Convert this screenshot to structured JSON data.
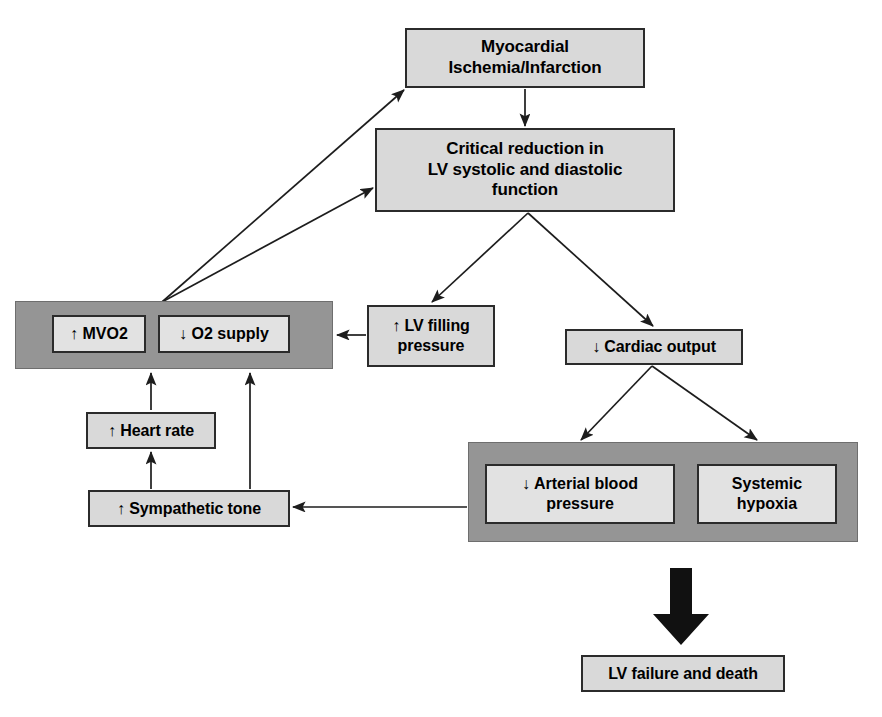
{
  "diagram": {
    "colors": {
      "group_fill": "#959595",
      "node_fill": "#d9d9d9",
      "inner_fill": "#e2e2e2",
      "stroke": "#2b2b2b",
      "text": "#000000",
      "fat_arrow": "#111111"
    },
    "nodes": [
      {
        "id": "myocardial",
        "label": "Myocardial\nIschemia/Infarction",
        "x": 405,
        "y": 28,
        "w": 240,
        "h": 60,
        "font": 17
      },
      {
        "id": "critical",
        "label": "Critical reduction in\nLV systolic and diastolic\nfunction",
        "x": 375,
        "y": 128,
        "w": 300,
        "h": 84,
        "font": 17
      },
      {
        "id": "lv-filling",
        "label": "↑ LV filling\npressure",
        "x": 367,
        "y": 305,
        "w": 128,
        "h": 62,
        "font": 16
      },
      {
        "id": "cardiac-output",
        "label": "↓ Cardiac output",
        "x": 565,
        "y": 329,
        "w": 178,
        "h": 36,
        "font": 16
      },
      {
        "id": "heart-rate",
        "label": "↑ Heart rate",
        "x": 86,
        "y": 412,
        "w": 130,
        "h": 37,
        "font": 16
      },
      {
        "id": "sympathetic",
        "label": "↑ Sympathetic tone",
        "x": 88,
        "y": 490,
        "w": 202,
        "h": 37,
        "font": 16
      },
      {
        "id": "lv-failure",
        "label": "LV failure and death",
        "x": 581,
        "y": 655,
        "w": 204,
        "h": 37,
        "font": 16
      }
    ],
    "groups": [
      {
        "id": "oxygen-balance-group",
        "x": 15,
        "y": 301,
        "w": 318,
        "h": 68,
        "children": [
          {
            "id": "mvo2",
            "label": "↑ MVO2",
            "x": 52,
            "y": 315,
            "w": 94,
            "h": 38,
            "font": 16
          },
          {
            "id": "o2-supply",
            "label": "↓ O2 supply",
            "x": 158,
            "y": 315,
            "w": 132,
            "h": 38,
            "font": 16
          }
        ]
      },
      {
        "id": "systemic-consequences-group",
        "x": 468,
        "y": 442,
        "w": 390,
        "h": 100,
        "children": [
          {
            "id": "arterial-bp",
            "label": "↓ Arterial blood\npressure",
            "x": 485,
            "y": 464,
            "w": 190,
            "h": 60,
            "font": 16
          },
          {
            "id": "systemic-hypoxia",
            "label": "Systemic\nhypoxia",
            "x": 697,
            "y": 464,
            "w": 140,
            "h": 60,
            "font": 16
          }
        ]
      }
    ],
    "connectors": [
      {
        "id": "oxygen-to-myocardial",
        "from": "oxygen-balance-group",
        "to": "myocardial",
        "points": "162,302 404,90",
        "arrow": "end"
      },
      {
        "id": "oxygen-to-critical",
        "from": "oxygen-balance-group",
        "to": "critical",
        "points": "162,302 373,188",
        "arrow": "end"
      },
      {
        "id": "myocardial-to-critical",
        "from": "myocardial",
        "to": "critical",
        "points": "525,89 525,126",
        "arrow": "end"
      },
      {
        "id": "critical-to-lv-filling",
        "from": "critical",
        "to": "lv-filling",
        "points": "528,213 432,302",
        "arrow": "end"
      },
      {
        "id": "critical-to-cardiac-output",
        "from": "critical",
        "to": "cardiac-output",
        "points": "528,213 653,326",
        "arrow": "end"
      },
      {
        "id": "lv-filling-to-o2-supply",
        "from": "lv-filling",
        "to": "o2-supply",
        "points": "366,335 337,335",
        "arrow": "end"
      },
      {
        "id": "cardiac-to-arterial-bp",
        "from": "cardiac-output",
        "to": "arterial-bp",
        "points": "652,366 581,440",
        "arrow": "end"
      },
      {
        "id": "cardiac-to-hypoxia",
        "from": "cardiac-output",
        "to": "systemic-hypoxia",
        "points": "652,366 757,440",
        "arrow": "end"
      },
      {
        "id": "systemic-to-sympathetic",
        "from": "systemic-consequences-group",
        "to": "sympathetic",
        "points": "467,507 293,507",
        "arrow": "end"
      },
      {
        "id": "sympathetic-to-heart-rate",
        "from": "sympathetic",
        "to": "heart-rate",
        "points": "151,489 151,452",
        "arrow": "end"
      },
      {
        "id": "heart-rate-to-mvo2",
        "from": "heart-rate",
        "to": "mvo2",
        "points": "151,410 151,373",
        "arrow": "end"
      },
      {
        "id": "sympathetic-to-o2-supply",
        "from": "sympathetic",
        "to": "o2-supply",
        "points": "250,489 250,373",
        "arrow": "end"
      }
    ],
    "fat_arrow": {
      "id": "outcome-arrow",
      "x": 652,
      "y": 568,
      "w": 58,
      "h": 78
    }
  }
}
